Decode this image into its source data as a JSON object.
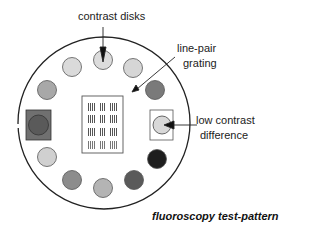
{
  "labels": {
    "contrast_disks": "contrast disks",
    "line_pair_1": "line-pair",
    "line_pair_2": "grating",
    "low_contrast_1": "low contrast",
    "low_contrast_2": "difference",
    "caption": "fluoroscopy test-pattern"
  },
  "colors": {
    "outline": "#222222",
    "disk_very_light": "#dcdcdc",
    "disk_light": "#c8c8c8",
    "disk_mid": "#a0a0a0",
    "disk_dark": "#6a6a6a",
    "disk_black": "#1e1e1e",
    "square_fill": "#707070"
  }
}
